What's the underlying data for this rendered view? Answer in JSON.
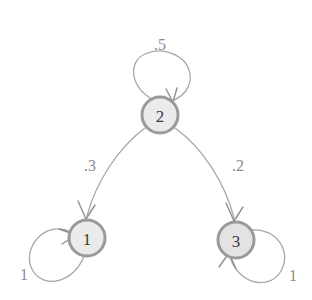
{
  "diagram": {
    "type": "markov-chain-state-diagram",
    "background_color": "#ffffff",
    "node_stroke_color": "#9a9a9a",
    "node_fill_color": "#ebebeb",
    "node_text_color": "#3a3a3a",
    "edge_color": "#a8a8a8",
    "label_color": "#8c8c8c",
    "states": [
      {
        "id": "1",
        "label": "1",
        "cx": 87,
        "cy": 238,
        "r": 18
      },
      {
        "id": "2",
        "label": "2",
        "cx": 160,
        "cy": 115,
        "r": 18
      },
      {
        "id": "3",
        "label": "3",
        "cx": 236,
        "cy": 240,
        "r": 18
      }
    ],
    "transitions": [
      {
        "id": "t-2-2",
        "from": "2",
        "to": "2",
        "weight": ".5",
        "kind": "self-loop",
        "label_x": 160,
        "label_y": 44
      },
      {
        "id": "t-2-1",
        "from": "2",
        "to": "1",
        "weight": ".3",
        "kind": "curved-edge",
        "label_x": 90,
        "label_y": 165
      },
      {
        "id": "t-2-3",
        "from": "2",
        "to": "3",
        "weight": ".2",
        "kind": "curved-edge",
        "label_x": 238,
        "label_y": 165
      },
      {
        "id": "t-1-1",
        "from": "1",
        "to": "1",
        "weight": "1",
        "kind": "self-loop",
        "label_x": 24,
        "label_y": 274
      },
      {
        "id": "t-3-3",
        "from": "3",
        "to": "3",
        "weight": "1",
        "kind": "self-loop",
        "label_x": 293,
        "label_y": 275
      }
    ]
  }
}
